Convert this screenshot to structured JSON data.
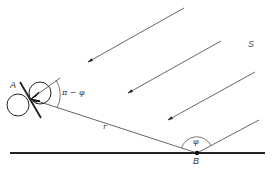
{
  "figure": {
    "labels": {
      "point_a": "A",
      "point_b": "B",
      "source": "S",
      "distance": "r",
      "angle_at_a": "π − φ",
      "angle_at_b": "φ"
    },
    "colors": {
      "ink": "#222222",
      "thin_line": "#555555",
      "background": "#ffffff"
    },
    "elements": {
      "incoming_rays": 4,
      "ground_line": "horizontal baseline through B",
      "connector": "line segment r from A to B",
      "reflected_ray": "ray leaving B upward-right",
      "detector": "dipole-like figure of two circles with crossing axis at A"
    }
  }
}
